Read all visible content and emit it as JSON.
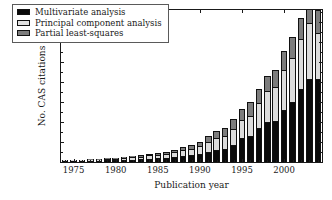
{
  "chart_data": {
    "type": "bar",
    "subtype": "stacked-bar",
    "title": "",
    "xlabel": "Publication year",
    "ylabel": "No. CAS citations",
    "xlim": [
      1973.5,
      2004.5
    ],
    "ylim": [
      0,
      3800
    ],
    "yticks": [
      0,
      500,
      1000,
      1500,
      2000,
      2500,
      3000,
      3500
    ],
    "ytick_labels": [
      "0",
      "500",
      "1000",
      "1500",
      "2000",
      "2500",
      "3000",
      "3500"
    ],
    "xticks": [
      1975,
      1980,
      1985,
      1990,
      1995,
      2000
    ],
    "xtick_labels": [
      "1975",
      "1980",
      "1985",
      "1990",
      "1995",
      "2000"
    ],
    "grid": false,
    "legend_position": "upper left",
    "categories": [
      1974,
      1975,
      1976,
      1977,
      1978,
      1979,
      1980,
      1981,
      1982,
      1983,
      1984,
      1985,
      1986,
      1987,
      1988,
      1989,
      1990,
      1991,
      1992,
      1993,
      1994,
      1995,
      1996,
      1997,
      1998,
      1999,
      2000,
      2001,
      2002,
      2003,
      2004
    ],
    "series": [
      {
        "name": "Multivariate analysis",
        "color": "#0a0a0a",
        "values": [
          5,
          10,
          20,
          30,
          35,
          40,
          45,
          50,
          60,
          70,
          85,
          95,
          105,
          120,
          150,
          165,
          200,
          260,
          310,
          315,
          430,
          605,
          640,
          845,
          1010,
          1020,
          1290,
          1490,
          1820,
          2065,
          2065
        ]
      },
      {
        "name": "Principal component analysis",
        "color": "#dcdcdc",
        "values": [
          5,
          10,
          15,
          20,
          25,
          30,
          40,
          45,
          55,
          65,
          80,
          90,
          100,
          120,
          150,
          170,
          210,
          250,
          290,
          330,
          400,
          435,
          520,
          640,
          760,
          860,
          1010,
          1120,
          1245,
          1420,
          1165
        ]
      },
      {
        "name": "Partial least-squares",
        "color": "#7d7d7d",
        "values": [
          3,
          5,
          8,
          10,
          12,
          15,
          18,
          20,
          25,
          30,
          35,
          40,
          45,
          55,
          70,
          80,
          100,
          130,
          170,
          200,
          240,
          290,
          330,
          350,
          390,
          420,
          480,
          510,
          540,
          580,
          580
        ]
      }
    ]
  },
  "legend": {
    "items": [
      {
        "label": "Multivariate analysis",
        "swatch": "mva"
      },
      {
        "label": "Principal component analysis",
        "swatch": "pca"
      },
      {
        "label": "Partial least-squares",
        "swatch": "pls"
      }
    ]
  },
  "axes": {
    "y_title": "No. CAS citations",
    "x_title": "Publication year"
  }
}
